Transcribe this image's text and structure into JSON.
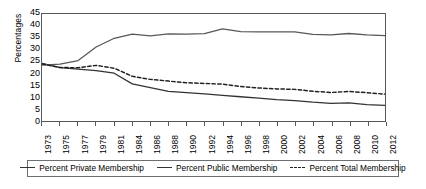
{
  "chart_data": {
    "type": "line",
    "title": "",
    "xlabel": "",
    "ylabel": "Percentages",
    "ylim": [
      0,
      45
    ],
    "ytick_step": 5,
    "yticks": [
      45,
      40,
      35,
      30,
      25,
      20,
      15,
      10,
      5,
      0
    ],
    "grid": false,
    "legend_position": "bottom",
    "categories": [
      "1973",
      "1975",
      "1977",
      "1979",
      "1981",
      "1984",
      "1986",
      "1988",
      "1990",
      "1992",
      "1994",
      "1996",
      "1998",
      "2000",
      "2002",
      "2004",
      "2006",
      "2008",
      "2010",
      "2012"
    ],
    "x": [
      "1973",
      "1975",
      "1977",
      "1979",
      "1981",
      "1984",
      "1986",
      "1988",
      "1990",
      "1992",
      "1994",
      "1996",
      "1998",
      "2000",
      "2002",
      "2004",
      "2006",
      "2008",
      "2010",
      "2012"
    ],
    "series": [
      {
        "name": "Percent Private Membership",
        "style": "solid",
        "color": "#333333",
        "values": [
          24.2,
          22.4,
          21.8,
          21.2,
          20.1,
          15.6,
          14.0,
          12.5,
          11.9,
          11.4,
          10.8,
          10.2,
          9.6,
          9.0,
          8.6,
          7.9,
          7.4,
          7.6,
          6.9,
          6.6
        ]
      },
      {
        "name": "Percent Public Membership",
        "style": "solid",
        "color": "#58585a",
        "values": [
          23.5,
          23.9,
          25.4,
          31.1,
          34.8,
          36.5,
          35.8,
          36.6,
          36.5,
          36.7,
          38.7,
          37.6,
          37.5,
          37.5,
          37.5,
          36.4,
          36.2,
          36.8,
          36.2,
          35.9
        ]
      },
      {
        "name": "Percent Total Membership",
        "style": "dashed",
        "color": "#222222",
        "values": [
          24.0,
          22.5,
          22.4,
          23.4,
          22.2,
          18.8,
          17.5,
          16.8,
          16.1,
          15.8,
          15.5,
          14.5,
          13.9,
          13.5,
          13.3,
          12.5,
          12.0,
          12.4,
          11.9,
          11.3
        ]
      }
    ]
  },
  "legend": {
    "items": [
      {
        "label": "Percent Private Membership",
        "style": "solid"
      },
      {
        "label": "Percent Public Membership",
        "style": "solid"
      },
      {
        "label": "Percent Total Membership",
        "style": "dashed"
      }
    ]
  }
}
